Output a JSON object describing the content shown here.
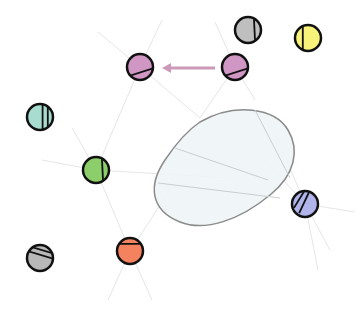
{
  "canvas": {
    "width": 357,
    "height": 314,
    "background": "#ffffff"
  },
  "region": {
    "name": "blob-region",
    "fill": "#eef5f7",
    "stroke": "#8a8a8a",
    "path": "M 200 122 C 235 102, 275 108, 288 130 C 300 150, 295 175, 270 195 C 240 220, 205 232, 180 222 C 150 210, 148 185, 165 160 C 175 145, 185 132, 200 122 Z"
  },
  "edges": {
    "color": "#e6e6e6",
    "width": 1,
    "lines": [
      [
        98,
        32,
        140,
        67
      ],
      [
        140,
        67,
        162,
        20
      ],
      [
        140,
        67,
        96,
        170
      ],
      [
        140,
        67,
        200,
        118
      ],
      [
        235,
        67,
        215,
        22
      ],
      [
        235,
        67,
        200,
        118
      ],
      [
        235,
        67,
        255,
        100
      ],
      [
        96,
        170,
        42,
        160
      ],
      [
        96,
        170,
        72,
        128
      ],
      [
        96,
        170,
        130,
        251
      ],
      [
        96,
        170,
        230,
        178
      ],
      [
        130,
        251,
        108,
        300
      ],
      [
        130,
        251,
        152,
        300
      ],
      [
        130,
        251,
        170,
        190
      ],
      [
        305,
        204,
        260,
        155
      ],
      [
        305,
        204,
        355,
        212
      ],
      [
        305,
        204,
        330,
        250
      ],
      [
        305,
        204,
        318,
        270
      ],
      [
        305,
        204,
        270,
        120
      ]
    ]
  },
  "region_inner_lines": {
    "color": "#c9cfd1",
    "lines": [
      [
        175,
        148,
        268,
        180
      ],
      [
        158,
        183,
        280,
        198
      ],
      [
        255,
        110,
        290,
        178
      ]
    ]
  },
  "arrow": {
    "from": [
      215,
      68
    ],
    "to": [
      162,
      68
    ],
    "color": "#cc9ab8",
    "width": 3
  },
  "nodes": [
    {
      "id": "node-pink-left",
      "cx": 140,
      "cy": 67,
      "r": 13,
      "fill": "#d197c4",
      "marks": "diag-bottom"
    },
    {
      "id": "node-pink-right",
      "cx": 235,
      "cy": 67,
      "r": 13,
      "fill": "#d197c4",
      "marks": "diag-bottom"
    },
    {
      "id": "node-gray-top",
      "cx": 248,
      "cy": 30,
      "r": 13,
      "fill": "#bfbfbf",
      "marks": "vert-right"
    },
    {
      "id": "node-yellow",
      "cx": 308,
      "cy": 38,
      "r": 13,
      "fill": "#f7f27a",
      "marks": "vert-left"
    },
    {
      "id": "node-teal",
      "cx": 40,
      "cy": 117,
      "r": 13,
      "fill": "#a8dcd0",
      "marks": "double-vert-right"
    },
    {
      "id": "node-green",
      "cx": 96,
      "cy": 170,
      "r": 13,
      "fill": "#8ccf6a",
      "marks": "vert-right"
    },
    {
      "id": "node-gray-bottom",
      "cx": 40,
      "cy": 258,
      "r": 13,
      "fill": "#b8b8b8",
      "marks": "double-diag-top"
    },
    {
      "id": "node-orange",
      "cx": 130,
      "cy": 251,
      "r": 13,
      "fill": "#f5825e",
      "marks": "horiz-top"
    },
    {
      "id": "node-blue",
      "cx": 305,
      "cy": 204,
      "r": 13,
      "fill": "#b0b4ea",
      "marks": "double-diag-left"
    }
  ],
  "node_stroke": "#111111",
  "node_stroke_width": 2.5
}
